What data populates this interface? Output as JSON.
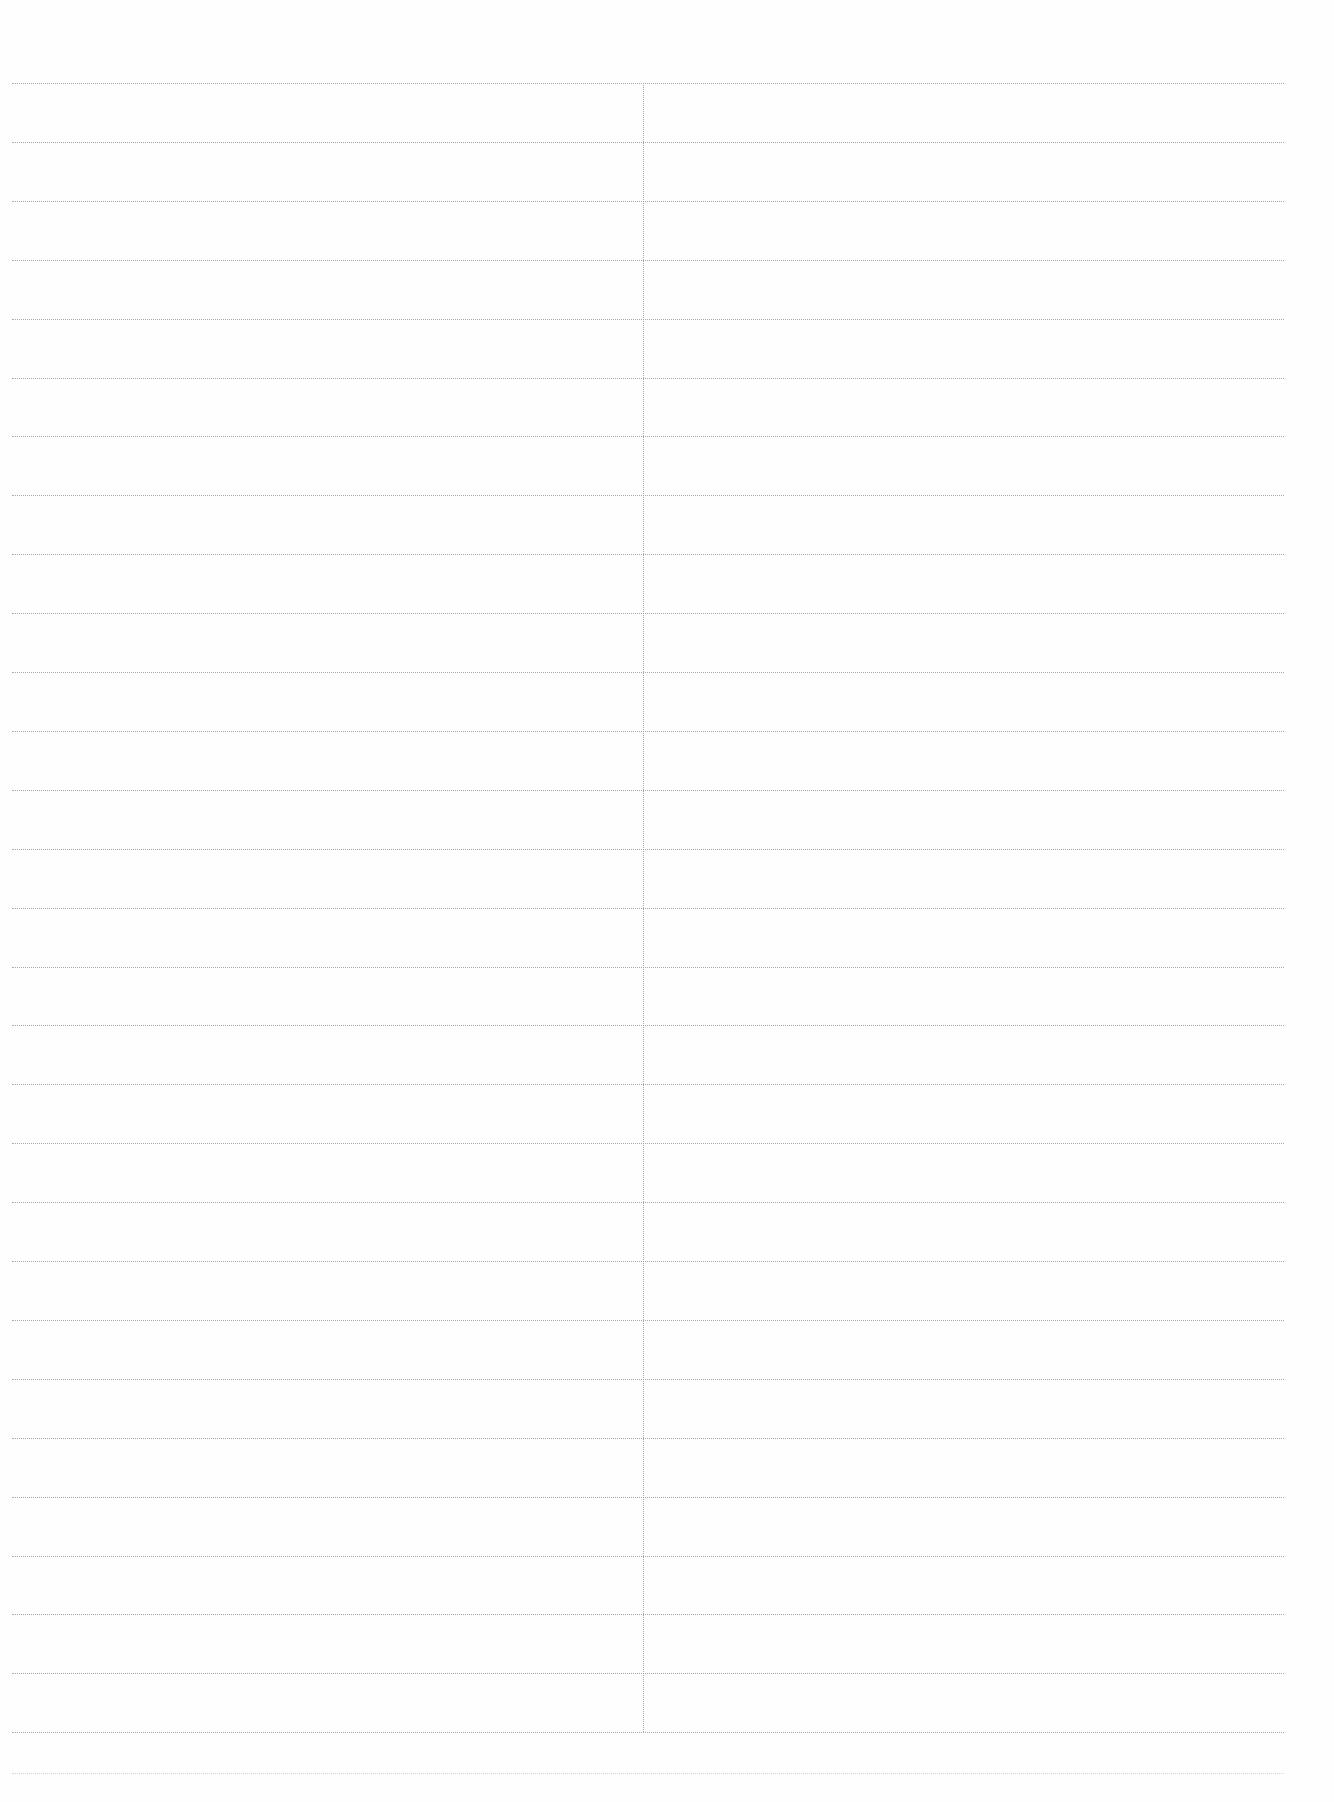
{
  "page": {
    "type": "blank ruled sheet",
    "columns": 2,
    "ruled_lines": 29,
    "left_column_text": [],
    "right_column_text": []
  }
}
